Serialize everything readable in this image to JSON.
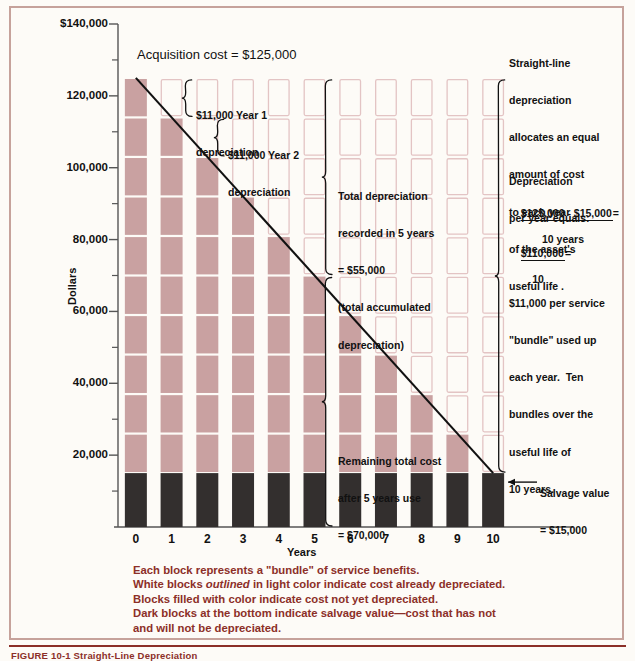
{
  "figure": {
    "caption": "FIGURE 10-1  Straight-Line Depreciation",
    "frame_color": "#c6a29b",
    "caption_color": "#8c2f28",
    "fill_color": "#c9a1a1",
    "outline_color": "#e3c4c4",
    "salvage_color": "#332f2e"
  },
  "axes": {
    "y_title": "Dollars",
    "x_title": "Years",
    "y_ticks": [
      "$140,000",
      "120,000",
      "100,000",
      "80,000",
      "60,000",
      "40,000",
      "20,000"
    ],
    "y_minor_count": 7,
    "x_ticks": [
      "0",
      "1",
      "2",
      "3",
      "4",
      "5",
      "6",
      "7",
      "8",
      "9",
      "10"
    ]
  },
  "annotations": {
    "acquisition": "Acquisition cost = $125,000",
    "year1": [
      "$11,000 Year 1",
      "depreciation"
    ],
    "year2": [
      "$11,000 Year 2",
      "depreciation"
    ],
    "total_dep": [
      "Total depreciation",
      "recorded in 5 years",
      "= $55,000",
      "(total accumulated",
      "depreciation)"
    ],
    "remaining": [
      "Remaining total cost",
      "after 5 years use",
      "= $70,000"
    ],
    "salvage": [
      "Salvage value",
      "= $15,000"
    ],
    "right_p1": [
      "Straight-line",
      "depreciation",
      "allocates an equal",
      "amount of cost",
      "to each year",
      "of the asset's",
      "useful life ."
    ],
    "right_p2": [
      "Depreciation",
      "per year equals:"
    ],
    "formula1_num": "$125,000 - $15,000",
    "formula1_den": "10 years",
    "formula1_eq": "=",
    "formula2_num": "$110,000",
    "formula2_den": "10",
    "formula2_eq": "=",
    "right_p3": [
      "$11,000 per service",
      "\"bundle\" used up",
      "each year.  Ten",
      "bundles over the",
      "useful life of",
      "10 years."
    ]
  },
  "caption_block": {
    "line1": "Each block represents a \"bundle\" of service benefits.",
    "line2a": "White blocks ",
    "line2b": "outlined",
    "line2c": " in light color indicate cost already depreciated.",
    "line3": "Blocks filled with color indicate cost not yet depreciated.",
    "line4": "Dark blocks at the bottom indicate salvage value—cost that has not",
    "line5": "and will not be depreciated."
  },
  "chart_data": {
    "type": "bar",
    "title": "Straight-Line Depreciation",
    "xlabel": "Years",
    "ylabel": "Dollars",
    "ylim": [
      0,
      140000
    ],
    "grid": false,
    "categories": [
      "0",
      "1",
      "2",
      "3",
      "4",
      "5",
      "6",
      "7",
      "8",
      "9",
      "10"
    ],
    "acquisition_cost": 125000,
    "salvage_value": 15000,
    "depreciable_base": 110000,
    "useful_life_years": 10,
    "annual_depreciation": 11000,
    "block_value": 11000,
    "blocks_per_bar": 10,
    "series": [
      {
        "name": "Book value (total cost remaining)",
        "values": [
          125000,
          114000,
          103000,
          92000,
          81000,
          70000,
          59000,
          48000,
          37000,
          26000,
          15000
        ]
      },
      {
        "name": "Filled blocks (cost not yet depreciated)",
        "values": [
          10,
          9,
          8,
          7,
          6,
          5,
          4,
          3,
          2,
          1,
          0
        ]
      },
      {
        "name": "Outlined blocks (cost already depreciated)",
        "values": [
          0,
          1,
          2,
          3,
          4,
          5,
          6,
          7,
          8,
          9,
          10
        ]
      },
      {
        "name": "Salvage block (never depreciated)",
        "values": [
          15000,
          15000,
          15000,
          15000,
          15000,
          15000,
          15000,
          15000,
          15000,
          15000,
          15000
        ]
      }
    ],
    "line": {
      "name": "Straight-line book value",
      "x": [
        0,
        10
      ],
      "y": [
        125000,
        15000
      ]
    }
  }
}
